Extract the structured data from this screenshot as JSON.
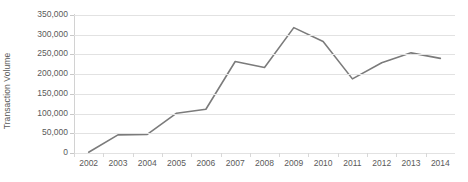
{
  "chart_data": {
    "type": "line",
    "title": "",
    "xlabel": "",
    "ylabel": "Transaction Volume",
    "categories": [
      "2002",
      "2003",
      "2004",
      "2005",
      "2006",
      "2007",
      "2008",
      "2009",
      "2010",
      "2011",
      "2012",
      "2013",
      "2014"
    ],
    "values": [
      2000,
      46000,
      47000,
      101000,
      111000,
      232000,
      217000,
      318000,
      283000,
      188000,
      229000,
      254000,
      240000
    ],
    "series": [
      {
        "name": "Transaction Volume",
        "values": [
          2000,
          46000,
          47000,
          101000,
          111000,
          232000,
          217000,
          318000,
          283000,
          188000,
          229000,
          254000,
          240000
        ]
      }
    ],
    "ylim": [
      0,
      350000
    ],
    "ytick_values": [
      0,
      50000,
      100000,
      150000,
      200000,
      250000,
      300000,
      350000
    ],
    "ytick_labels": [
      "0",
      "50,000",
      "100,000",
      "150,000",
      "200,000",
      "250,000",
      "300,000",
      "350,000"
    ],
    "xtick_labels": [
      "2002",
      "2003",
      "2004",
      "2005",
      "2006",
      "2007",
      "2008",
      "2009",
      "2010",
      "2011",
      "2012",
      "2013",
      "2014"
    ],
    "grid": true,
    "grid_axis": "y",
    "legend": false,
    "legend_position": "none",
    "annotations": [],
    "colors": {
      "line": "#7b7b7b",
      "grid": "#e2e2e2",
      "axis": "#d2d2d2",
      "text": "#5a5a5a",
      "background": "#ffffff"
    },
    "line_width": 1.6
  }
}
